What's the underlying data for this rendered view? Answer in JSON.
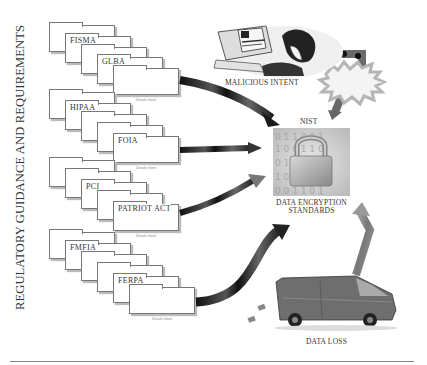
{
  "diagram": {
    "side_title": "REGULATORY GUIDANCE AND REQUIREMENTS",
    "folder_groups": [
      {
        "labels": [
          "FISMA",
          "GLBA"
        ]
      },
      {
        "labels": [
          "HIPAA",
          "FOIA"
        ]
      },
      {
        "labels": [
          "PCI",
          "PATRIOT ACT"
        ]
      },
      {
        "labels": [
          "FMFIA",
          "FERPA"
        ]
      }
    ],
    "folder_caption": "Details sheet",
    "nodes": {
      "malicious_intent": "MALICIOUS INTENT",
      "nist": "NIST",
      "data_encryption": "DATA ENCRYPTION",
      "standards": "STANDARDS",
      "data_loss": "DATA LOSS"
    },
    "colors": {
      "arrow_dark": "#1a1a1a",
      "arrow_gray": "#8a8a8a",
      "burst": "#c8c8c8",
      "folder_border": "#777777"
    }
  }
}
